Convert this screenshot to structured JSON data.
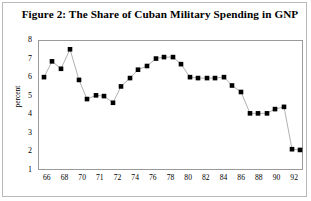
{
  "figure": {
    "title": "Figure 2: The Share of Cuban Military Spending in GNP"
  },
  "axes": {
    "ylabel": "percent",
    "y_ticks": [
      "1",
      "2",
      "3",
      "4",
      "5",
      "6",
      "7",
      "8"
    ],
    "x_ticks": [
      "66",
      "68",
      "70",
      "71",
      "72",
      "74",
      "76",
      "78",
      "80",
      "82",
      "84",
      "86",
      "88",
      "90",
      "92"
    ]
  },
  "style": {
    "marker_color": "#000000",
    "line_color": "#9d9d9d",
    "axis_color": "#9a9a9a",
    "frame_color": "#b9b9b9",
    "background": "#ffffff"
  },
  "chart_data": {
    "type": "line",
    "title": "Figure 2: The Share of Cuban Military Spending in GNP",
    "xlabel": "",
    "ylabel": "percent",
    "ylim": [
      1,
      8
    ],
    "xlim": [
      1965.4,
      1992.6
    ],
    "grid": false,
    "legend": null,
    "marker": "square",
    "x_tick_values": [
      66,
      68,
      70,
      71,
      72,
      74,
      76,
      78,
      80,
      82,
      84,
      86,
      88,
      90,
      92
    ],
    "y_tick_values": [
      1,
      2,
      3,
      4,
      5,
      6,
      7,
      8
    ],
    "series": [
      {
        "name": "Cuban military spending share of GNP",
        "x": [
          1966,
          1967,
          1968,
          1969,
          1970,
          1971,
          1972,
          1973,
          1974,
          1975,
          1976,
          1977,
          1978,
          1979,
          1980,
          1981,
          1982,
          1983,
          1984,
          1985,
          1986,
          1987,
          1988,
          1989,
          1990,
          1991,
          1992,
          1993,
          1994
        ],
        "values": [
          6.0,
          6.85,
          6.45,
          7.5,
          5.85,
          4.9,
          5.05,
          5.0,
          4.65,
          5.5,
          5.95,
          6.4,
          6.6,
          7.0,
          7.05,
          6.7,
          6.25,
          5.85,
          5.9,
          5.85,
          5.95,
          5.55,
          5.2,
          4.05,
          4.05,
          4.05,
          4.25,
          4.4,
          2.1
        ],
        "labels": [
          "66",
          "",
          "68",
          "",
          "70",
          "71",
          "72",
          "",
          "73",
          "74",
          "",
          "75",
          "76",
          "",
          "77",
          "78",
          "",
          "80",
          "",
          "81",
          "82",
          "",
          "84",
          "86",
          "",
          "88",
          "",
          "90",
          "92"
        ]
      }
    ]
  },
  "points": [
    {
      "x": 44,
      "y": 6.0
    },
    {
      "x": 52,
      "y": 6.85
    },
    {
      "x": 61,
      "y": 6.45
    },
    {
      "x": 70,
      "y": 7.5
    },
    {
      "x": 79,
      "y": 5.85
    },
    {
      "x": 87,
      "y": 4.82
    },
    {
      "x": 96,
      "y": 5.02
    },
    {
      "x": 104,
      "y": 4.98
    },
    {
      "x": 113,
      "y": 4.62
    },
    {
      "x": 121,
      "y": 5.5
    },
    {
      "x": 130,
      "y": 5.95
    },
    {
      "x": 138,
      "y": 6.4
    },
    {
      "x": 147,
      "y": 6.6
    },
    {
      "x": 156,
      "y": 7.0
    },
    {
      "x": 164,
      "y": 7.08
    },
    {
      "x": 173,
      "y": 7.08
    },
    {
      "x": 181,
      "y": 6.7
    },
    {
      "x": 190,
      "y": 6.0
    },
    {
      "x": 198,
      "y": 5.95
    },
    {
      "x": 207,
      "y": 5.95
    },
    {
      "x": 215,
      "y": 5.95
    },
    {
      "x": 224,
      "y": 6.0
    },
    {
      "x": 232,
      "y": 5.55
    },
    {
      "x": 241,
      "y": 5.2
    },
    {
      "x": 250,
      "y": 4.05
    },
    {
      "x": 258,
      "y": 4.05
    },
    {
      "x": 267,
      "y": 4.05
    },
    {
      "x": 275,
      "y": 4.28
    },
    {
      "x": 284,
      "y": 4.4
    },
    {
      "x": 292,
      "y": 2.12
    },
    {
      "x": 300,
      "y": 2.08
    }
  ]
}
